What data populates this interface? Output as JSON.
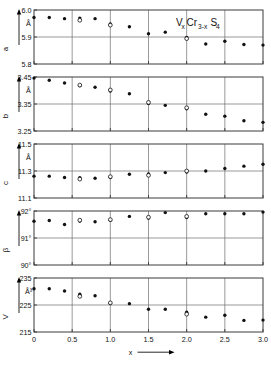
{
  "figure": {
    "title": "VxCr3-xS4",
    "title_parts": {
      "v": "V",
      "vsub": "x",
      "cr": "Cr",
      "crsub": "3-x",
      "s": "S",
      "ssub": "4"
    },
    "xlabel": "x",
    "x_ticks": [
      "0",
      "0.5",
      "1.0",
      "1.5",
      "2.0",
      "2.5",
      "3.0"
    ],
    "x_tick_values": [
      0,
      0.5,
      1.0,
      1.5,
      2.0,
      2.5,
      3.0
    ],
    "xlim": [
      0,
      3.0
    ],
    "gridlines_x": [
      0.5,
      1.0,
      1.5,
      2.0,
      2.5
    ],
    "marker_legend": {
      "filled": "filled-circle",
      "open": "open-circle"
    }
  },
  "chart_data": [
    {
      "type": "scatter",
      "panel_id": "a",
      "ylabel": "a",
      "unit": "Å",
      "ylim": [
        5.8,
        6.0
      ],
      "y_ticks": [
        "6.0",
        "5.9",
        "5.8"
      ],
      "y_tick_values": [
        6.0,
        5.9,
        5.8
      ],
      "gridlines_y": [
        5.9
      ],
      "title": "VxCr3-xS4",
      "xlabel": "x",
      "grid": true,
      "series": [
        {
          "name": "filled",
          "marker": "filled-circle",
          "x": [
            0.0,
            0.2,
            0.4,
            0.6,
            0.8,
            1.0,
            1.25,
            1.5,
            1.72,
            2.0,
            2.25,
            2.5,
            2.75,
            3.0
          ],
          "values": [
            5.972,
            5.972,
            5.968,
            5.97,
            5.968,
            5.948,
            5.938,
            5.912,
            5.918,
            5.898,
            5.874,
            5.884,
            5.872,
            5.87
          ]
        },
        {
          "name": "open",
          "marker": "open-circle",
          "x": [
            0.6,
            1.0,
            2.0
          ],
          "values": [
            5.962,
            5.944,
            5.894
          ]
        }
      ]
    },
    {
      "type": "scatter",
      "panel_id": "b",
      "ylabel": "b",
      "unit": "Å",
      "ylim": [
        3.25,
        3.45
      ],
      "y_ticks": [
        "3.45",
        "3.35",
        "3.25"
      ],
      "y_tick_values": [
        3.45,
        3.35,
        3.25
      ],
      "gridlines_y": [
        3.35
      ],
      "xlabel": "x",
      "grid": true,
      "series": [
        {
          "name": "filled",
          "marker": "filled-circle",
          "x": [
            0.0,
            0.2,
            0.4,
            0.6,
            0.8,
            1.0,
            1.25,
            1.5,
            1.72,
            2.0,
            2.25,
            2.5,
            2.75,
            3.0
          ],
          "values": [
            3.446,
            3.438,
            3.428,
            3.418,
            3.412,
            3.398,
            3.388,
            3.352,
            3.345,
            3.332,
            3.312,
            3.305,
            3.288,
            3.282
          ]
        },
        {
          "name": "open",
          "marker": "open-circle",
          "x": [
            0.6,
            1.0,
            1.5,
            2.0
          ],
          "values": [
            3.42,
            3.402,
            3.356,
            3.336
          ]
        }
      ]
    },
    {
      "type": "scatter",
      "panel_id": "c",
      "ylabel": "c",
      "unit": "Å",
      "ylim": [
        11.1,
        11.5
      ],
      "y_ticks": [
        "11.5",
        "11.3",
        "11.1"
      ],
      "y_tick_values": [
        11.5,
        11.3,
        11.1
      ],
      "gridlines_y": [
        11.3
      ],
      "xlabel": "x",
      "grid": true,
      "series": [
        {
          "name": "filled",
          "marker": "filled-circle",
          "x": [
            0.0,
            0.2,
            0.4,
            0.6,
            0.8,
            1.0,
            1.25,
            1.5,
            1.72,
            2.0,
            2.25,
            2.5,
            2.75,
            3.0
          ],
          "values": [
            11.262,
            11.262,
            11.252,
            11.25,
            11.246,
            11.252,
            11.276,
            11.278,
            11.288,
            11.292,
            11.3,
            11.318,
            11.336,
            11.35
          ]
        },
        {
          "name": "open",
          "marker": "open-circle",
          "x": [
            0.6,
            1.0,
            1.5,
            2.0
          ],
          "values": [
            11.24,
            11.258,
            11.268,
            11.3
          ]
        }
      ]
    },
    {
      "type": "scatter",
      "panel_id": "beta",
      "ylabel": "β",
      "unit": "",
      "ylim": [
        90,
        92
      ],
      "y_ticks": [
        "92°",
        "91°",
        "90°"
      ],
      "y_tick_values": [
        92,
        91,
        90
      ],
      "gridlines_y": [
        91
      ],
      "xlabel": "x",
      "grid": true,
      "series": [
        {
          "name": "filled",
          "marker": "filled-circle",
          "x": [
            0.0,
            0.2,
            0.4,
            0.6,
            0.8,
            1.0,
            1.25,
            1.5,
            1.72,
            2.0,
            2.25,
            2.5,
            2.75,
            3.0
          ],
          "values": [
            91.62,
            91.65,
            91.5,
            91.63,
            91.6,
            91.66,
            91.8,
            91.74,
            91.94,
            91.76,
            91.9,
            91.9,
            91.9,
            91.96
          ]
        },
        {
          "name": "open",
          "marker": "open-circle",
          "x": [
            0.6,
            1.0,
            1.5,
            2.0
          ],
          "values": [
            91.66,
            91.68,
            91.77,
            91.8
          ]
        }
      ]
    },
    {
      "type": "scatter",
      "panel_id": "V",
      "ylabel": "V",
      "unit": "Å³",
      "ylim": [
        215,
        235
      ],
      "y_ticks": [
        "235",
        "225",
        "215"
      ],
      "y_tick_values": [
        235,
        225,
        215
      ],
      "gridlines_y": [
        225
      ],
      "xlabel": "x",
      "grid": true,
      "series": [
        {
          "name": "filled",
          "marker": "filled-circle",
          "x": [
            0.0,
            0.2,
            0.4,
            0.6,
            0.8,
            1.0,
            1.25,
            1.5,
            1.72,
            2.0,
            2.25,
            2.5,
            2.75,
            3.0
          ],
          "values": [
            231.0,
            231.0,
            230.2,
            229.0,
            228.4,
            225.6,
            225.5,
            223.4,
            223.4,
            222.3,
            220.5,
            221.2,
            219.3,
            219.4
          ]
        },
        {
          "name": "open",
          "marker": "open-circle",
          "x": [
            0.6,
            1.0,
            2.0
          ],
          "values": [
            228.2,
            225.8,
            221.6
          ]
        }
      ]
    }
  ]
}
